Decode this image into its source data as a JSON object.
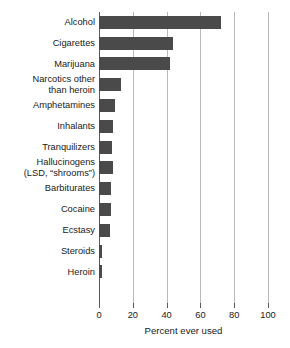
{
  "chart_data": {
    "type": "bar",
    "orientation": "horizontal",
    "title": "",
    "xlabel": "Percent ever used",
    "ylabel": "",
    "xlim": [
      0,
      100
    ],
    "xticks": [
      0,
      20,
      40,
      60,
      80,
      100
    ],
    "xtick_labels": [
      "0",
      "20",
      "40",
      "60",
      "80",
      "100"
    ],
    "grid": "vertical",
    "legend": "none",
    "bar_color": "#4a4a4a",
    "gridline_color": "#b9b9b9",
    "axis_color": "#585858",
    "background": "#ffffff",
    "categories": [
      "Alcohol",
      "Cigarettes",
      "Marijuana",
      "Narcotics other than heroin",
      "Amphetamines",
      "Inhalants",
      "Tranquilizers",
      "Hallucinogens (LSD, “shrooms”)",
      "Barbiturates",
      "Cocaine",
      "Ecstasy",
      "Steroids",
      "Heroin"
    ],
    "category_lines": [
      [
        "Alcohol"
      ],
      [
        "Cigarettes"
      ],
      [
        "Marijuana"
      ],
      [
        "Narcotics other",
        "than heroin"
      ],
      [
        "Amphetamines"
      ],
      [
        "Inhalants"
      ],
      [
        "Tranquilizers"
      ],
      [
        "Hallucinogens",
        "(LSD, “shrooms”)"
      ],
      [
        "Barbiturates"
      ],
      [
        "Cocaine"
      ],
      [
        "Ecstasy"
      ],
      [
        "Steroids"
      ],
      [
        "Heroin"
      ]
    ],
    "values": [
      72,
      44,
      42,
      13,
      9.5,
      8.5,
      7.5,
      8,
      7,
      7,
      6.5,
      2,
      1.5
    ]
  }
}
